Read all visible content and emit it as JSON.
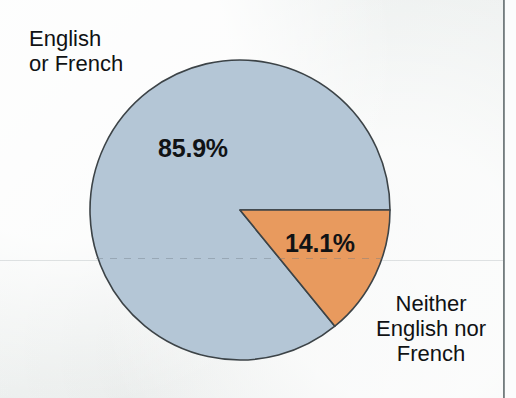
{
  "chart_data": {
    "type": "pie",
    "title": "",
    "subtitle": "",
    "xlabel": "",
    "ylabel": "",
    "legend_position": "callout-labels",
    "grid": false,
    "units": "percent",
    "categories": [
      "English or French",
      "Neither English nor French"
    ],
    "values": [
      85.9,
      14.1
    ],
    "value_labels": [
      "85.9%",
      "14.1%"
    ],
    "colors": [
      "#b4c6d6",
      "#e89a5e"
    ],
    "start_angle_deg": 0,
    "direction": "clockwise",
    "slices": [
      {
        "name": "English or French",
        "value": 85.9,
        "value_label": "85.9%",
        "color": "#b4c6d6",
        "label_lines": [
          "English",
          "or French"
        ],
        "label_position": "top-left"
      },
      {
        "name": "Neither English nor French",
        "value": 14.1,
        "value_label": "14.1%",
        "color": "#e89a5e",
        "label_lines": [
          "Neither",
          "English nor",
          "French"
        ],
        "label_position": "bottom-right"
      }
    ]
  },
  "labels": {
    "major_percent": "85.9%",
    "minor_percent": "14.1%",
    "major_category": {
      "line1": "English",
      "line2": "or French"
    },
    "minor_category": {
      "line1": "Neither",
      "line2": "English nor",
      "line3": "French"
    }
  },
  "style": {
    "slice_major_color": "#b4c6d6",
    "slice_minor_color": "#e89a5e",
    "outline_color": "#3c4347",
    "background_color": "#f1f4f3",
    "text_color": "#101214"
  }
}
